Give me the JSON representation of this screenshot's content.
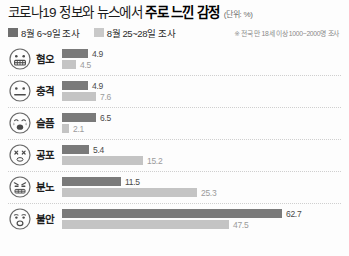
{
  "header": {
    "title_main": "코로나19 정보와 뉴스에서",
    "title_strong": "주로 느낀 감정",
    "unit": "(단위: %)",
    "source_note": "※ 전국 만 18세 이상 1000~2000명 조사"
  },
  "legend": {
    "items": [
      {
        "label": "8월 6~9일 조사",
        "color": "#6f6f6f",
        "style": "dark"
      },
      {
        "label": "8월 25~28일 조사",
        "color": "#c9c9c9",
        "style": "light"
      }
    ]
  },
  "chart_data": {
    "type": "bar",
    "orientation": "horizontal",
    "title": "코로나19 정보와 뉴스에서 주로 느낀 감정",
    "xlabel": "",
    "ylabel": "",
    "unit": "%",
    "grid": false,
    "legend_position": "top-left",
    "xlim": [
      0,
      70
    ],
    "categories": [
      "혐오",
      "충격",
      "슬픔",
      "공포",
      "분노",
      "불안"
    ],
    "series": [
      {
        "name": "8월 6~9일 조사",
        "color": "#7a7a7a",
        "values": [
          4.9,
          4.9,
          6.5,
          5.4,
          11.5,
          62.7
        ]
      },
      {
        "name": "8월 25~28일 조사",
        "color": "#c4c4c4",
        "values": [
          4.5,
          7.6,
          2.1,
          15.2,
          25.3,
          47.5
        ]
      }
    ],
    "annotation": "※ 전국 만 18세 이상 1000~2000명 조사"
  },
  "rows": [
    {
      "label": "혐오",
      "icon": "grimacing-face-icon",
      "top": {
        "value": "4.9",
        "width_px": 26
      },
      "bottom": {
        "value": "4.5",
        "width_px": 14
      }
    },
    {
      "label": "충격",
      "icon": "neutral-shocked-face-icon",
      "top": {
        "value": "4.9",
        "width_px": 26
      },
      "bottom": {
        "value": "7.6",
        "width_px": 34
      }
    },
    {
      "label": "슬픔",
      "icon": "crying-face-icon",
      "top": {
        "value": "6.5",
        "width_px": 34
      },
      "bottom": {
        "value": "2.1",
        "width_px": 7
      }
    },
    {
      "label": "공포",
      "icon": "fearful-squinting-face-icon",
      "top": {
        "value": "5.4",
        "width_px": 27
      },
      "bottom": {
        "value": "15.2",
        "width_px": 81
      }
    },
    {
      "label": "분노",
      "icon": "angry-face-icon",
      "top": {
        "value": "11.5",
        "width_px": 59
      },
      "bottom": {
        "value": "25.3",
        "width_px": 135
      }
    },
    {
      "label": "불안",
      "icon": "anxious-face-icon",
      "top": {
        "value": "62.7",
        "width_px": 220
      },
      "bottom": {
        "value": "47.5",
        "width_px": 167
      }
    }
  ]
}
